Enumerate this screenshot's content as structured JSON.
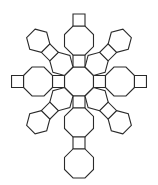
{
  "diagram": {
    "type": "polyhedron-net",
    "stroke_color": "#2a2a2a",
    "fill_color": "#ffffff",
    "background": "#ffffff",
    "edge_length": 12,
    "center": [
      79,
      81.5
    ],
    "faces": {
      "octagons": 6,
      "squares": 12,
      "hexagons": 8
    },
    "arms": [
      {
        "direction": "up",
        "angle": -90,
        "sequence": [
          "square",
          "octagon",
          "square"
        ]
      },
      {
        "direction": "down",
        "angle": 90,
        "sequence": [
          "square",
          "octagon",
          "square",
          "octagon"
        ]
      },
      {
        "direction": "left",
        "angle": 180,
        "sequence": [
          "square",
          "octagon",
          "square"
        ]
      },
      {
        "direction": "right",
        "angle": 0,
        "sequence": [
          "square",
          "octagon",
          "square"
        ]
      },
      {
        "direction": "up-left",
        "angle": -135,
        "sequence": [
          "hexagon",
          "square",
          "hexagon"
        ]
      },
      {
        "direction": "up-right",
        "angle": -45,
        "sequence": [
          "hexagon",
          "square",
          "hexagon"
        ]
      },
      {
        "direction": "down-left",
        "angle": 135,
        "sequence": [
          "hexagon",
          "square",
          "hexagon"
        ]
      },
      {
        "direction": "down-right",
        "angle": 45,
        "sequence": [
          "hexagon",
          "square",
          "hexagon"
        ]
      }
    ]
  }
}
